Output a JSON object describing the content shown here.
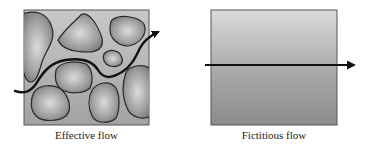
{
  "figure": {
    "panels": [
      {
        "id": "effective",
        "caption": "Effective flow",
        "description": "Porous medium with grains; tortuous flow path arrow weaving between grains"
      },
      {
        "id": "fictitious",
        "caption": "Fictitious flow",
        "description": "Homogenized medium; straight horizontal flow arrow"
      }
    ],
    "colors": {
      "background": "#ffffff",
      "matrix_gray": "#b4b4b4",
      "grain_light": "#d6d6d6",
      "grain_dark": "#7a7a7a",
      "outline": "#2a2a2a",
      "arrow": "#111111",
      "gradient_top": "#d9d9d9",
      "gradient_bottom": "#8e8e8e"
    }
  }
}
